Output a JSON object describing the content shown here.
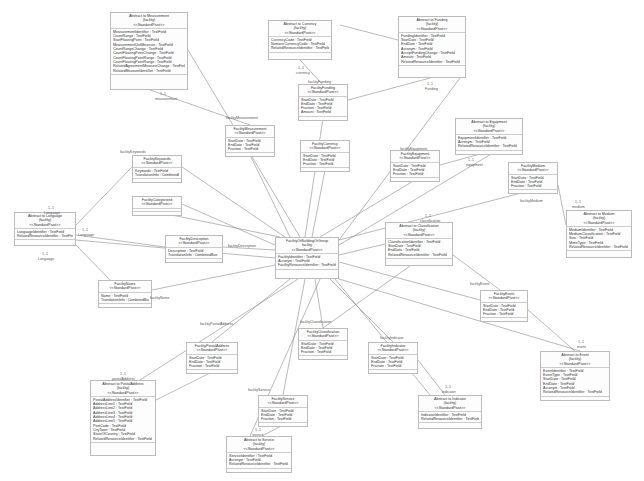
{
  "diagram": {
    "type": "UML class diagram",
    "central_class": {
      "name": "FacilityOrBuildingOrGroup",
      "stereotype": "<<StandardPivot>>",
      "attributes": [
        "FacilityIdentifier : TextField",
        "Acronym : TextField",
        "FacilityResourceIdentifier : TextField"
      ]
    },
    "classes": [
      {
        "id": "measurement",
        "title": "Abstract to Measurement",
        "sub": "(facility)",
        "stereo": "<<StandardPivot>>",
        "attrs": [
          "MeasurementIdentifier : TextField",
          "CountRange : TextField",
          "StartFloatingPoint : TextField",
          "MeasurementUnitMeasure : TextField",
          "CountRangeChange : TextField",
          "CountFloatingPointChange : TextField",
          "CountFloatingPointRange : TextField",
          "CountFloatingPointRange : TextField",
          "RelatedAgreementMeasureChange : TextField",
          "RelatedMeasureIdentifier : TextField"
        ],
        "x": 110,
        "y": 12,
        "w": 78,
        "h": 78
      },
      {
        "id": "currency",
        "title": "Abstract to Currency",
        "sub": "(facility)",
        "stereo": "<<StandardPivot>>",
        "attrs": [
          "CurrencyCode : TextField",
          "NumericCurrencyCode : TextField",
          "RelatedResourceIdentifier : TextField"
        ],
        "x": 268,
        "y": 20,
        "w": 64,
        "h": 40
      },
      {
        "id": "funding",
        "title": "Abstract to Funding",
        "sub": "(facility)",
        "stereo": "<<StandardPivot>>",
        "attrs": [
          "FundingIdentifier : TextField",
          "StartDate : TextField",
          "EndDate : TextField",
          "Acronym : TextField",
          "AcceptFundingChange : TextField",
          "Amount : TextField",
          "RelatedResourceIdentifier : TextField"
        ],
        "x": 398,
        "y": 16,
        "w": 68,
        "h": 62
      },
      {
        "id": "facilityfunding",
        "title": "FacilityFunding",
        "sub": "",
        "stereo": "<<StandardPivot>>",
        "attrs": [
          "StartDate : TextField",
          "EndDate : TextField",
          "Fraction : TextField",
          "Amount : TextField"
        ],
        "x": 298,
        "y": 84,
        "w": 50,
        "h": 34
      },
      {
        "id": "facilitymeasurement",
        "title": "FacilityMeasurement",
        "sub": "",
        "stereo": "<<StandardPivot>>",
        "attrs": [
          "StartDate : TextField",
          "EndDate : TextField",
          "Fraction : TextField"
        ],
        "x": 225,
        "y": 125,
        "w": 50,
        "h": 30
      },
      {
        "id": "facilitycurrency",
        "title": "FacilityCurrency",
        "sub": "",
        "stereo": "<<StandardPivot>>",
        "attrs": [
          "StartDate : TextField",
          "EndDate : TextField",
          "Fraction : TextField"
        ],
        "x": 300,
        "y": 140,
        "w": 50,
        "h": 30
      },
      {
        "id": "equipment",
        "title": "Abstract to Equipment",
        "sub": "(facility)",
        "stereo": "<<StandardPivot>>",
        "attrs": [
          "EquipmentIdentifier : TextField",
          "Acronym : TextField",
          "RelatedResourceIdentifier : TextField"
        ],
        "x": 455,
        "y": 118,
        "w": 68,
        "h": 36
      },
      {
        "id": "facilityequipment",
        "title": "FacilityEquipment",
        "sub": "",
        "stereo": "<<StandardPivot>>",
        "attrs": [
          "StartDate : TextField",
          "EndDate : TextField",
          "Fraction : TextField"
        ],
        "x": 390,
        "y": 150,
        "w": 50,
        "h": 30
      },
      {
        "id": "facilitykeywords",
        "title": "FacilityKeywords",
        "sub": "",
        "stereo": "<<StandardPivot>>",
        "attrs": [
          "Keywords : TextField",
          "TranslationInfo : CombinedBox"
        ],
        "x": 132,
        "y": 155,
        "w": 50,
        "h": 24
      },
      {
        "id": "facilitymedium",
        "title": "FacilityMedium",
        "sub": "",
        "stereo": "<<StandardPivot>>",
        "attrs": [
          "StartDate : TextField",
          "EndDate : TextField",
          "Fraction : TextField"
        ],
        "x": 508,
        "y": 162,
        "w": 50,
        "h": 28
      },
      {
        "id": "facilitycategorized",
        "title": "FacilityCategorized",
        "sub": "",
        "stereo": "<<StandardPivot>>",
        "attrs": [],
        "x": 132,
        "y": 196,
        "w": 50,
        "h": 16
      },
      {
        "id": "medium",
        "title": "Abstract to Medium",
        "sub": "(facility)",
        "stereo": "<<StandardPivot>>",
        "attrs": [
          "MediumIdentifier : TextField",
          "MediumClassification : TextField",
          "Size : TextField",
          "MimeType : TextField",
          "RelatedResourceIdentifier : TextField"
        ],
        "x": 566,
        "y": 210,
        "w": 66,
        "h": 48
      },
      {
        "id": "language",
        "title": "Abstract to Language",
        "sub": "(facility)",
        "stereo": "<<StandardPivot>>",
        "attrs": [
          "LanguageIdentifier : TextField",
          "RelatedResourceIdentifier : TextField"
        ],
        "x": 14,
        "y": 212,
        "w": 62,
        "h": 34
      },
      {
        "id": "facilitydescription",
        "title": "FacilityDescription",
        "sub": "",
        "stereo": "<<StandardPivot>>",
        "attrs": [
          "Description : TextField",
          "TranslationInfo : CombinedBox"
        ],
        "x": 165,
        "y": 235,
        "w": 58,
        "h": 24
      },
      {
        "id": "central",
        "title": "FacilityOrBuildingOrGroup",
        "sub": "facility",
        "stereo": "<<StandardPivot>>",
        "attrs": [
          "FacilityIdentifier : TextField",
          "Acronym : TextField",
          "FacilityResourceIdentifier : TextField"
        ],
        "x": 275,
        "y": 237,
        "w": 64,
        "h": 42
      },
      {
        "id": "classification",
        "title": "Abstract to Classification",
        "sub": "(facility)",
        "stereo": "<<StandardPivot>>",
        "attrs": [
          "ClassificationIdentifier : TextField",
          "StartDate : TextField",
          "EndDate : TextField",
          "RelatedResourceIdentifier : TextField"
        ],
        "x": 385,
        "y": 222,
        "w": 68,
        "h": 44
      },
      {
        "id": "facilityname",
        "title": "FacilityName",
        "sub": "",
        "stereo": "<<StandardPivot>>",
        "attrs": [
          "Name : TextField",
          "TranslationInfo : CombinedBox"
        ],
        "x": 98,
        "y": 280,
        "w": 54,
        "h": 26
      },
      {
        "id": "facilityevent",
        "title": "FacilityEvent",
        "sub": "",
        "stereo": "<<StandardPivot>>",
        "attrs": [
          "StartDate : TextField",
          "EndDate : TextField",
          "Fraction : TextField"
        ],
        "x": 480,
        "y": 290,
        "w": 48,
        "h": 30
      },
      {
        "id": "facilitypostaladdress",
        "title": "FacilityPostalAddress",
        "sub": "",
        "stereo": "<<StandardPivot>>",
        "attrs": [
          "StartDate : TextField",
          "EndDate : TextField",
          "Fraction : TextField"
        ],
        "x": 186,
        "y": 342,
        "w": 52,
        "h": 30
      },
      {
        "id": "facilityclassification",
        "title": "FacilityClassification",
        "sub": "",
        "stereo": "<<StandardPivot>>",
        "attrs": [
          "StartDate : TextField",
          "EndDate : TextField",
          "Fraction : TextField"
        ],
        "x": 298,
        "y": 328,
        "w": 50,
        "h": 30
      },
      {
        "id": "facilityindicator",
        "title": "FacilityIndicator",
        "sub": "",
        "stereo": "<<StandardPivot>>",
        "attrs": [
          "StartDate : TextField",
          "EndDate : TextField",
          "Fraction : TextField"
        ],
        "x": 368,
        "y": 342,
        "w": 50,
        "h": 30
      },
      {
        "id": "event",
        "title": "Abstract to Event",
        "sub": "(facility)",
        "stereo": "<<StandardPivot>>",
        "attrs": [
          "EventIdentifier : TextField",
          "EventType : TextField",
          "StartDate : TextField",
          "EndDate : TextField",
          "Acronym : TextField",
          "RelatedResourceIdentifier : TextField"
        ],
        "x": 540,
        "y": 351,
        "w": 70,
        "h": 50
      },
      {
        "id": "postaladdress",
        "title": "Abstract to PostalAddress",
        "sub": "(facility)",
        "stereo": "<<StandardPivot>>",
        "attrs": [
          "PostalAddressIdentifier : TextField",
          "AddressLine1 : TextField",
          "AddressLine2 : TextField",
          "AddressLine3 : TextField",
          "AddressLine4 : TextField",
          "AddressLine5 : TextField",
          "PostCode : TextField",
          "CityTown : TextField",
          "StateOfCountry : TextField",
          "RelatedResourceIdentifier : TextField"
        ],
        "x": 90,
        "y": 380,
        "w": 66,
        "h": 76
      },
      {
        "id": "facilityservice",
        "title": "FacilityService",
        "sub": "",
        "stereo": "<<StandardPivot>>",
        "attrs": [
          "StartDate : TextField",
          "EndDate : TextField",
          "Fraction : TextField"
        ],
        "x": 258,
        "y": 395,
        "w": 50,
        "h": 30
      },
      {
        "id": "indicator",
        "title": "Abstract to Indicator",
        "sub": "(facility)",
        "stereo": "<<StandardPivot>>",
        "attrs": [
          "IndicatorIdentifier : TextField",
          "RelatedResourceIdentifier : TextField"
        ],
        "x": 418,
        "y": 395,
        "w": 64,
        "h": 34
      },
      {
        "id": "service",
        "title": "Abstract to Service",
        "sub": "(facility)",
        "stereo": "<<StandardPivot>>",
        "attrs": [
          "ServiceIdentifier : TextField",
          "Acronym : TextField",
          "RelatedResourceIdentifier : TextField"
        ],
        "x": 226,
        "y": 436,
        "w": 66,
        "h": 36
      }
    ],
    "labels": [
      {
        "t": "1..1",
        "x": 160,
        "y": 92
      },
      {
        "t": "measurement",
        "x": 155,
        "y": 97
      },
      {
        "t": "1..1",
        "x": 298,
        "y": 66
      },
      {
        "t": "currency",
        "x": 296,
        "y": 71
      },
      {
        "t": "1..1",
        "x": 427,
        "y": 82
      },
      {
        "t": "Funding",
        "x": 425,
        "y": 87
      },
      {
        "t": "facilityFunding",
        "x": 308,
        "y": 80
      },
      {
        "t": "facilityMeasurement",
        "x": 226,
        "y": 116
      },
      {
        "t": "1..1",
        "x": 468,
        "y": 158
      },
      {
        "t": "equipment",
        "x": 466,
        "y": 163
      },
      {
        "t": "facilityKeywords",
        "x": 120,
        "y": 150
      },
      {
        "t": "facilityEquipment",
        "x": 400,
        "y": 147
      },
      {
        "t": "1..1",
        "x": 48,
        "y": 206
      },
      {
        "t": "Language",
        "x": 44,
        "y": 211
      },
      {
        "t": "1..1",
        "x": 82,
        "y": 228
      },
      {
        "t": "Language",
        "x": 78,
        "y": 233
      },
      {
        "t": "1..1",
        "x": 42,
        "y": 252
      },
      {
        "t": "Language",
        "x": 38,
        "y": 257
      },
      {
        "t": "1..1",
        "x": 575,
        "y": 200
      },
      {
        "t": "medium",
        "x": 572,
        "y": 205
      },
      {
        "t": "facilityMedium",
        "x": 520,
        "y": 199
      },
      {
        "t": "facilityDescription",
        "x": 228,
        "y": 244
      },
      {
        "t": "1..1",
        "x": 425,
        "y": 214
      },
      {
        "t": "classification",
        "x": 420,
        "y": 219
      },
      {
        "t": "facilityName",
        "x": 150,
        "y": 296
      },
      {
        "t": "facilityEvent",
        "x": 470,
        "y": 282
      },
      {
        "t": "facilityPostalAddress",
        "x": 200,
        "y": 322
      },
      {
        "t": "facilityClassification",
        "x": 300,
        "y": 320
      },
      {
        "t": "facilityIndicator",
        "x": 380,
        "y": 336
      },
      {
        "t": "1..1",
        "x": 578,
        "y": 340
      },
      {
        "t": "event",
        "x": 577,
        "y": 345
      },
      {
        "t": "1..1",
        "x": 120,
        "y": 372
      },
      {
        "t": "postalAddress",
        "x": 112,
        "y": 377
      },
      {
        "t": "facilityService",
        "x": 248,
        "y": 388
      },
      {
        "t": "1..1",
        "x": 445,
        "y": 385
      },
      {
        "t": "indicator",
        "x": 442,
        "y": 390
      },
      {
        "t": "1..1",
        "x": 255,
        "y": 428
      },
      {
        "t": "service",
        "x": 252,
        "y": 433
      }
    ]
  }
}
